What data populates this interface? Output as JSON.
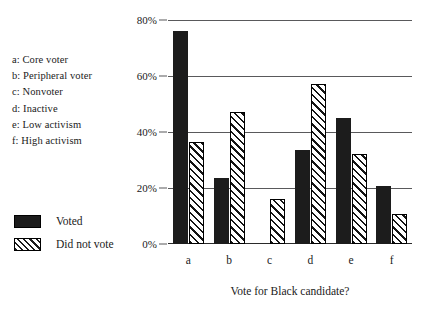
{
  "category_key": {
    "items": [
      "a: Core voter",
      "b: Peripheral voter",
      "c: Nonvoter",
      "d: Inactive",
      "e: Low activism",
      "f: High activism"
    ]
  },
  "chart_data": {
    "type": "bar",
    "title": "",
    "xlabel": "Vote for Black candidate?",
    "ylabel": "",
    "categories": [
      "a",
      "b",
      "c",
      "d",
      "e",
      "f"
    ],
    "ylim": [
      0,
      80
    ],
    "ytick_labels": [
      "0%",
      "20%",
      "40%",
      "60%",
      "80%"
    ],
    "ytick_values": [
      0,
      20,
      40,
      60,
      80
    ],
    "grid": true,
    "legend_position": "left",
    "series": [
      {
        "name": "Voted",
        "style": "solid",
        "color": "#1c1c1c",
        "values": [
          76,
          23.5,
          null,
          33.5,
          45,
          20.7
        ]
      },
      {
        "name": "Did not vote",
        "style": "hatched",
        "color": "#ffffff",
        "values": [
          36.5,
          47,
          16,
          57,
          32,
          10.7
        ]
      }
    ]
  }
}
